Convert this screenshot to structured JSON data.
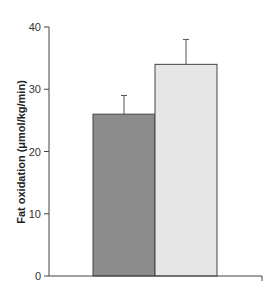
{
  "chart_data": {
    "type": "bar",
    "title": "",
    "xlabel": "",
    "ylabel": "Fat oxidation (μmol/kg/min)",
    "categories": [
      "Group 1",
      "Group 2"
    ],
    "values": [
      26,
      34
    ],
    "error": [
      3,
      4
    ],
    "colors": [
      "#8c8c8c",
      "#e6e6e6"
    ],
    "ylim": [
      0,
      40
    ],
    "yticks": [
      0,
      10,
      20,
      30,
      40
    ],
    "ytick_labels": [
      "0",
      "10",
      "20",
      "30",
      "40"
    ],
    "grid": false,
    "legend": null
  }
}
